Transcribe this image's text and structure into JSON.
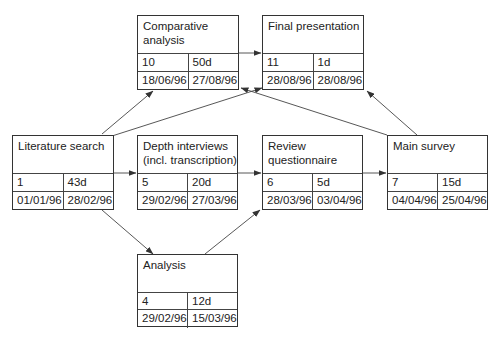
{
  "diagram": {
    "type": "activity-on-node network",
    "nodes": [
      {
        "id": "literature-search",
        "title": "Literature search",
        "number": "1",
        "duration": "43d",
        "start": "01/01/96",
        "finish": "28/02/96"
      },
      {
        "id": "comparative-analysis",
        "title": "Comparative\nanalysis",
        "number": "10",
        "duration": "50d",
        "start": "18/06/96",
        "finish": "27/08/96"
      },
      {
        "id": "final-presentation",
        "title": "Final presentation",
        "number": "11",
        "duration": "1d",
        "start": "28/08/96",
        "finish": "28/08/96"
      },
      {
        "id": "depth-interviews",
        "title": "Depth interviews\n(incl. transcription)",
        "number": "5",
        "duration": "20d",
        "start": "29/02/96",
        "finish": "27/03/96"
      },
      {
        "id": "review-questionnaire",
        "title": "Review\nquestionnaire",
        "number": "6",
        "duration": "5d",
        "start": "28/03/96",
        "finish": "03/04/96"
      },
      {
        "id": "main-survey",
        "title": "Main survey",
        "number": "7",
        "duration": "15d",
        "start": "04/04/96",
        "finish": "25/04/96"
      },
      {
        "id": "analysis",
        "title": "Analysis",
        "number": "4",
        "duration": "12d",
        "start": "29/02/96",
        "finish": "15/03/96"
      }
    ],
    "edges": [
      {
        "from": "literature-search",
        "to": "comparative-analysis"
      },
      {
        "from": "literature-search",
        "to": "final-presentation"
      },
      {
        "from": "literature-search",
        "to": "depth-interviews"
      },
      {
        "from": "literature-search",
        "to": "analysis"
      },
      {
        "from": "comparative-analysis",
        "to": "final-presentation"
      },
      {
        "from": "depth-interviews",
        "to": "review-questionnaire"
      },
      {
        "from": "analysis",
        "to": "review-questionnaire"
      },
      {
        "from": "review-questionnaire",
        "to": "main-survey"
      },
      {
        "from": "main-survey",
        "to": "final-presentation"
      },
      {
        "from": "main-survey",
        "to": "comparative-analysis"
      }
    ],
    "colors": {
      "line": "#333333",
      "background": "#ffffff"
    }
  }
}
